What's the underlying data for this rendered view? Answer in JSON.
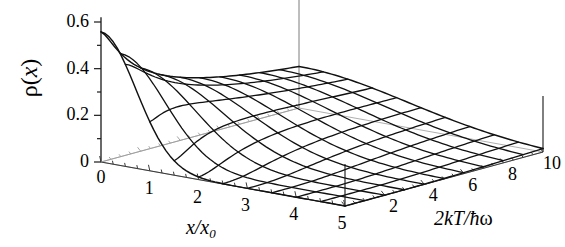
{
  "figure": {
    "kind": "3d-mesh-surface-plot",
    "background": "#ffffff",
    "line_color": "#111111",
    "axis_color": "#444444",
    "floor_color": "#9a9a9a"
  },
  "axes": {
    "vertical": {
      "label_rho": "ρ",
      "label_paren_open": "(",
      "label_var": "x",
      "label_paren_close": ")",
      "ticks": [
        "0.6",
        "0.4",
        "0.2",
        "0"
      ],
      "tick_values": [
        0.6,
        0.4,
        0.2,
        0
      ],
      "minor_step": 0.1,
      "range": [
        0,
        0.6
      ]
    },
    "x": {
      "label_num": "x",
      "label_slash": "/",
      "label_den": "x",
      "label_sub": "0",
      "ticks": [
        "0",
        "1",
        "2",
        "3",
        "4",
        "5"
      ],
      "tick_values": [
        0,
        1,
        2,
        3,
        4,
        5
      ],
      "minor_step": 0.25,
      "range": [
        0,
        5
      ]
    },
    "depth": {
      "label_coef": "2",
      "label_k": "k",
      "label_T": "T",
      "label_slash": "/",
      "label_hbar": "ħ",
      "label_omega": "ω",
      "ticks": [
        "2",
        "4",
        "6",
        "8",
        "10"
      ],
      "tick_values": [
        2,
        4,
        6,
        8,
        10
      ],
      "minor_step": 0.5,
      "range": [
        0,
        10
      ]
    }
  },
  "chart_data": {
    "type": "line",
    "title": "",
    "xlabel": "x/x_0",
    "ylabel": "rho(x)",
    "zlabel": "2kT/hbar*omega",
    "xlim": [
      0,
      5
    ],
    "ylim": [
      0,
      10
    ],
    "zlim": [
      0,
      0.6
    ],
    "grid": false,
    "legend": "none",
    "surface_note": "Thermal density rho(x) of a harmonic oscillator: rho(x) = (1/(x0*sqrt(2*pi*s)))*exp(-x^2/(2*s)) with s = coth(1/tau)/2 and tau = 2kT/hbar*omega; peak value approx 0.56 at x=0 for all temperatures.",
    "x": [
      0,
      0.25,
      0.5,
      0.75,
      1,
      1.25,
      1.5,
      1.75,
      2,
      2.25,
      2.5,
      2.75,
      3,
      3.25,
      3.5,
      3.75,
      4,
      4.25,
      4.5,
      4.75,
      5
    ],
    "series": [
      {
        "name": "2kT/hbar w = 0.5",
        "z": 0.5,
        "values": [
          0.564,
          0.547,
          0.498,
          0.427,
          0.342,
          0.257,
          0.183,
          0.123,
          0.078,
          0.047,
          0.027,
          0.014,
          0.007,
          0.003,
          0.0015,
          0.0006,
          0.0002,
          0.0001,
          3e-05,
          1e-05,
          0.0
        ]
      },
      {
        "name": "2kT/hbar w = 1.5",
        "z": 1.5,
        "values": [
          0.541,
          0.528,
          0.492,
          0.436,
          0.369,
          0.298,
          0.23,
          0.17,
          0.12,
          0.082,
          0.053,
          0.033,
          0.02,
          0.011,
          0.006,
          0.003,
          0.0015,
          0.0007,
          0.0003,
          0.0001,
          5e-05
        ]
      },
      {
        "name": "2kT/hbar w = 2.5",
        "z": 2.5,
        "values": [
          0.5,
          0.491,
          0.465,
          0.424,
          0.373,
          0.316,
          0.258,
          0.203,
          0.154,
          0.112,
          0.079,
          0.053,
          0.035,
          0.022,
          0.013,
          0.008,
          0.004,
          0.002,
          0.001,
          0.0005,
          0.0002
        ]
      },
      {
        "name": "2kT/hbar w = 3.5",
        "z": 3.5,
        "values": [
          0.462,
          0.455,
          0.436,
          0.405,
          0.365,
          0.319,
          0.27,
          0.222,
          0.176,
          0.135,
          0.1,
          0.072,
          0.05,
          0.034,
          0.022,
          0.014,
          0.008,
          0.005,
          0.003,
          0.0014,
          0.0007
        ]
      },
      {
        "name": "2kT/hbar w = 4.5",
        "z": 4.5,
        "values": [
          0.43,
          0.425,
          0.41,
          0.386,
          0.355,
          0.318,
          0.277,
          0.235,
          0.194,
          0.155,
          0.12,
          0.09,
          0.066,
          0.047,
          0.032,
          0.021,
          0.014,
          0.008,
          0.005,
          0.003,
          0.0016
        ]
      },
      {
        "name": "2kT/hbar w = 5.5",
        "z": 5.5,
        "values": [
          0.404,
          0.4,
          0.388,
          0.369,
          0.343,
          0.313,
          0.279,
          0.243,
          0.207,
          0.172,
          0.139,
          0.11,
          0.084,
          0.063,
          0.045,
          0.032,
          0.022,
          0.014,
          0.009,
          0.006,
          0.003
        ]
      },
      {
        "name": "2kT/hbar w = 6.5",
        "z": 6.5,
        "values": [
          0.382,
          0.379,
          0.369,
          0.353,
          0.331,
          0.306,
          0.277,
          0.246,
          0.214,
          0.183,
          0.152,
          0.124,
          0.098,
          0.076,
          0.057,
          0.042,
          0.03,
          0.021,
          0.014,
          0.009,
          0.006
        ]
      },
      {
        "name": "2kT/hbar w = 7.5",
        "z": 7.5,
        "values": [
          0.363,
          0.36,
          0.352,
          0.339,
          0.321,
          0.299,
          0.274,
          0.247,
          0.218,
          0.19,
          0.162,
          0.136,
          0.112,
          0.09,
          0.07,
          0.054,
          0.04,
          0.029,
          0.021,
          0.014,
          0.009
        ]
      },
      {
        "name": "2kT/hbar w = 8.5",
        "z": 8.5,
        "values": [
          0.347,
          0.344,
          0.337,
          0.326,
          0.311,
          0.292,
          0.27,
          0.246,
          0.22,
          0.194,
          0.168,
          0.144,
          0.121,
          0.1,
          0.081,
          0.064,
          0.049,
          0.037,
          0.027,
          0.019,
          0.014
        ]
      },
      {
        "name": "2kT/hbar w = 9.5",
        "z": 9.5,
        "values": [
          0.332,
          0.33,
          0.324,
          0.314,
          0.301,
          0.285,
          0.266,
          0.244,
          0.221,
          0.197,
          0.173,
          0.15,
          0.128,
          0.108,
          0.089,
          0.072,
          0.057,
          0.045,
          0.034,
          0.025,
          0.018
        ]
      },
      {
        "name": "2kT/hbar w = 10",
        "z": 10,
        "values": [
          0.326,
          0.324,
          0.318,
          0.309,
          0.296,
          0.281,
          0.264,
          0.243,
          0.221,
          0.198,
          0.175,
          0.152,
          0.131,
          0.111,
          0.092,
          0.076,
          0.061,
          0.048,
          0.037,
          0.028,
          0.021
        ]
      }
    ]
  }
}
